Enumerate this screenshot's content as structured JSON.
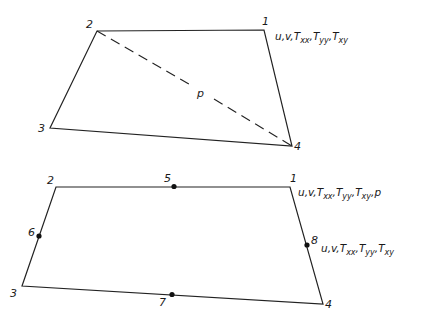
{
  "figure": {
    "top_element": {
      "description": "4-node quadrilateral element with pressure variable p at centroid",
      "nodes": [
        {
          "id": "1",
          "label": "1",
          "x": 264,
          "y": 30
        },
        {
          "id": "2",
          "label": "2",
          "x": 97,
          "y": 31
        },
        {
          "id": "3",
          "label": "3",
          "x": 50,
          "y": 128
        },
        {
          "id": "4",
          "label": "4",
          "x": 292,
          "y": 146
        }
      ],
      "interior_label": "p",
      "node1_variables": {
        "prefix": "u,v,",
        "terms": [
          {
            "base": "T",
            "sub": "xx"
          },
          {
            "base": "T",
            "sub": "yy"
          },
          {
            "base": "T",
            "sub": "xy"
          }
        ],
        "suffix": ""
      }
    },
    "bottom_element": {
      "description": "8-node quadrilateral element with mid-side nodes",
      "nodes": [
        {
          "id": "1",
          "label": "1",
          "x": 290,
          "y": 187
        },
        {
          "id": "2",
          "label": "2",
          "x": 56,
          "y": 187
        },
        {
          "id": "3",
          "label": "3",
          "x": 22,
          "y": 286
        },
        {
          "id": "4",
          "label": "4",
          "x": 323,
          "y": 304
        },
        {
          "id": "5",
          "label": "5",
          "x": 174,
          "y": 186
        },
        {
          "id": "6",
          "label": "6",
          "x": 39,
          "y": 236
        },
        {
          "id": "7",
          "label": "7",
          "x": 172,
          "y": 295
        },
        {
          "id": "8",
          "label": "8",
          "x": 307,
          "y": 245
        }
      ],
      "node1_variables": {
        "prefix": "u,v,",
        "terms": [
          {
            "base": "T",
            "sub": "xx"
          },
          {
            "base": "T",
            "sub": "yy"
          },
          {
            "base": "T",
            "sub": "xy"
          }
        ],
        "suffix": ",p"
      },
      "node8_variables": {
        "prefix": "u,v,",
        "terms": [
          {
            "base": "T",
            "sub": "xx"
          },
          {
            "base": "T",
            "sub": "yy"
          },
          {
            "base": "T",
            "sub": "xy"
          }
        ],
        "suffix": ""
      }
    }
  },
  "text": {
    "top": {
      "n1": "1",
      "n2": "2",
      "n3": "3",
      "n4": "4",
      "p": "p",
      "vars": {
        "u": "u,v,",
        "t1": "T",
        "s1": "xx",
        "c1": ",",
        "t2": "T",
        "s2": "yy",
        "c2": ",",
        "t3": "T",
        "s3": "xy"
      }
    },
    "bottom": {
      "n1": "1",
      "n2": "2",
      "n3": "3",
      "n4": "4",
      "n5": "5",
      "n6": "6",
      "n7": "7",
      "n8": "8",
      "vars1": {
        "u": "u,v,",
        "t1": "T",
        "s1": "xx",
        "c1": ",",
        "t2": "T",
        "s2": "yy",
        "c2": ",",
        "t3": "T",
        "s3": "xy",
        "tail": ",p"
      },
      "vars8": {
        "u": "u,v,",
        "t1": "T",
        "s1": "xx",
        "c1": ",",
        "t2": "T",
        "s2": "yy",
        "c2": ",",
        "t3": "T",
        "s3": "xy"
      }
    }
  }
}
